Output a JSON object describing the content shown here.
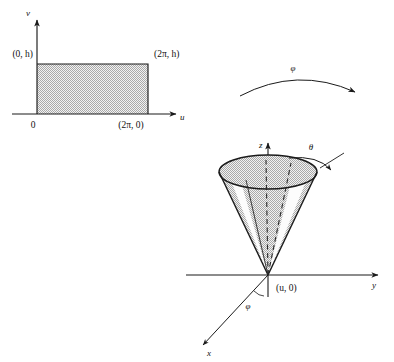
{
  "figure": {
    "background_color": "#ffffff",
    "ink_color": "#1a1a1a",
    "fill_gray": "#d2d2d2",
    "fill_gray_light": "#e6e6e6",
    "fill_white": "#fbfbfb"
  },
  "left_panel": {
    "name": "uv-parameter-rectangle",
    "axes": {
      "vertical_label": "v",
      "horizontal_label": "u",
      "origin_label": "0"
    },
    "corner_labels": {
      "top_left": "(0, h)",
      "top_right": "(2π, h)",
      "bottom_right": "(2π, 0)"
    },
    "region_fill": "#d2d2d2"
  },
  "map_arrow": {
    "name": "parametrization-map-arrow",
    "label": "φ",
    "direction": "left-to-right"
  },
  "right_panel": {
    "name": "cone-in-xyz-space",
    "axes": {
      "vertical_label": "z",
      "right_label": "y",
      "front_label": "x"
    },
    "apex_label": "(u, 0)",
    "angle_label": "θ",
    "azimuth_label": "φ",
    "cone_fill": "#d2d2d2",
    "cone_highlight_fill": "#fbfbfb",
    "cone_top_fill": "#d8d8d8"
  }
}
